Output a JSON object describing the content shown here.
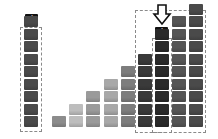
{
  "diagram": {
    "labels": {
      "large": "大",
      "small": "小"
    },
    "arrow_icon": "down-arrow-icon",
    "colors": {
      "label_bg": "#111111",
      "label_fg": "#ffffff",
      "dash": "#8a8a8a"
    },
    "columns": [
      {
        "x": 24,
        "blocks": 9,
        "color": "#4a4a4a",
        "highlight": "left-box"
      },
      {
        "x": 52,
        "blocks": 1,
        "color": "#8c8c8c"
      },
      {
        "x": 69,
        "blocks": 2,
        "color": "#bdbdbd"
      },
      {
        "x": 86,
        "blocks": 3,
        "color": "#9a9a9a"
      },
      {
        "x": 104,
        "blocks": 4,
        "color": "#a8a8a8"
      },
      {
        "x": 121,
        "blocks": 5,
        "color": "#7d7d7d"
      },
      {
        "x": 138,
        "blocks": 6,
        "color": "#3a3a3a"
      },
      {
        "x": 155,
        "blocks": 8,
        "color": "#2a2a2a",
        "label": "small"
      },
      {
        "x": 172,
        "blocks": 9,
        "color": "#555555"
      },
      {
        "x": 189,
        "blocks": 10,
        "color": "#4a4a4a"
      }
    ],
    "layout": {
      "bottom_y": 127,
      "row_pitch": 12.5
    }
  }
}
